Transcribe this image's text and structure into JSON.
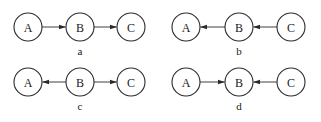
{
  "diagram": {
    "type": "directed-graph-panels",
    "node_radius": 14,
    "colors": {
      "stroke": "#2a2a2a",
      "fill": "#ffffff",
      "text": "#1a1a1a"
    },
    "panels": [
      {
        "id": "a",
        "caption": "a",
        "caption_pos": [
          80,
          55
        ],
        "nodes": [
          {
            "id": "A",
            "label": "A",
            "x": 28,
            "y": 27
          },
          {
            "id": "B",
            "label": "B",
            "x": 80,
            "y": 27
          },
          {
            "id": "C",
            "label": "C",
            "x": 131,
            "y": 27
          }
        ],
        "edges": [
          {
            "from": "A",
            "to": "B"
          },
          {
            "from": "B",
            "to": "C"
          }
        ]
      },
      {
        "id": "b",
        "caption": "b",
        "caption_pos": [
          239,
          55
        ],
        "nodes": [
          {
            "id": "A",
            "label": "A",
            "x": 186,
            "y": 27
          },
          {
            "id": "B",
            "label": "B",
            "x": 239,
            "y": 27
          },
          {
            "id": "C",
            "label": "C",
            "x": 291,
            "y": 27
          }
        ],
        "edges": [
          {
            "from": "B",
            "to": "A"
          },
          {
            "from": "C",
            "to": "B"
          }
        ]
      },
      {
        "id": "c",
        "caption": "c",
        "caption_pos": [
          80,
          110
        ],
        "nodes": [
          {
            "id": "A",
            "label": "A",
            "x": 28,
            "y": 82
          },
          {
            "id": "B",
            "label": "B",
            "x": 80,
            "y": 82
          },
          {
            "id": "C",
            "label": "C",
            "x": 131,
            "y": 82
          }
        ],
        "edges": [
          {
            "from": "B",
            "to": "A"
          },
          {
            "from": "B",
            "to": "C"
          }
        ]
      },
      {
        "id": "d",
        "caption": "d",
        "caption_pos": [
          239,
          110
        ],
        "nodes": [
          {
            "id": "A",
            "label": "A",
            "x": 186,
            "y": 82
          },
          {
            "id": "B",
            "label": "B",
            "x": 239,
            "y": 82
          },
          {
            "id": "C",
            "label": "C",
            "x": 291,
            "y": 82
          }
        ],
        "edges": [
          {
            "from": "A",
            "to": "B"
          },
          {
            "from": "C",
            "to": "B"
          }
        ]
      }
    ]
  }
}
